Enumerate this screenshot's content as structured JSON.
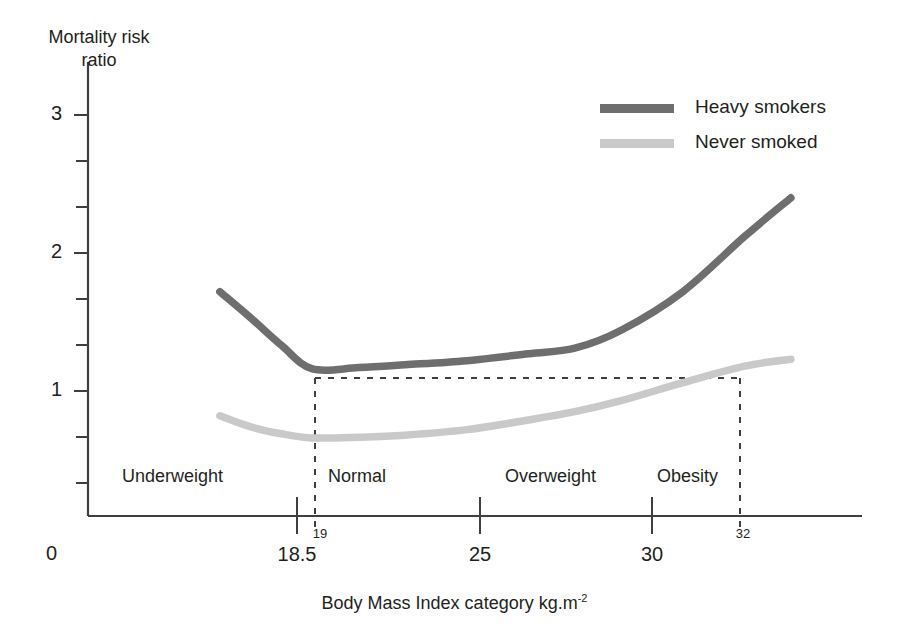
{
  "chart_data": {
    "type": "line",
    "title": "",
    "xlabel": "Body Mass Index category kg.m-2",
    "xlabel_main": "Body Mass Index category kg.m",
    "xlabel_exponent": "-2",
    "ylabel_line1": "Mortality risk",
    "ylabel_line2": "ratio",
    "grid": false,
    "legend_position": "top-right",
    "ylim": [
      0,
      3.3
    ],
    "xlim": [
      15,
      40
    ],
    "yticks_major": [
      "1",
      "2",
      "3"
    ],
    "yticks_major_values": [
      1,
      2,
      3
    ],
    "ytick_minor_count": 3,
    "origin_label": "0",
    "xticks": [
      {
        "label": "18.5",
        "value": 18.5
      },
      {
        "label": "25",
        "value": 25
      },
      {
        "label": "30",
        "value": 30
      }
    ],
    "reference_lines": [
      {
        "label": "19",
        "value": 19,
        "style": "dashed",
        "orientation": "vertical"
      },
      {
        "label": "32",
        "value": 32,
        "style": "dashed",
        "orientation": "vertical"
      }
    ],
    "horizontal_reference": {
      "label": "",
      "y_value": 1.16,
      "style": "dashed",
      "from_x": 19,
      "to_x": 32
    },
    "categories": [
      {
        "label": "Underweight",
        "from": 15,
        "to": 19
      },
      {
        "label": "Normal",
        "from": 19,
        "to": 25
      },
      {
        "label": "Overweight",
        "from": 25,
        "to": 30
      },
      {
        "label": "Obesity",
        "from": 30,
        "to": 32
      }
    ],
    "series": [
      {
        "name": "Heavy smokers",
        "color": "#6e6e6e",
        "x": [
          16.0,
          17.0,
          18.0,
          19.0,
          20.5,
          22.0,
          24.0,
          26.0,
          27.5,
          29.0,
          31.0,
          33.0,
          34.5
        ],
        "values": [
          1.72,
          1.53,
          1.33,
          1.16,
          1.17,
          1.19,
          1.22,
          1.27,
          1.31,
          1.44,
          1.72,
          2.12,
          2.4
        ]
      },
      {
        "name": "Never smoked",
        "color": "#c9c9c9",
        "x": [
          16.0,
          17.0,
          18.0,
          19.0,
          20.5,
          22.0,
          24.0,
          26.0,
          27.5,
          29.0,
          31.0,
          33.0,
          34.5
        ],
        "values": [
          0.82,
          0.74,
          0.69,
          0.66,
          0.665,
          0.68,
          0.72,
          0.79,
          0.85,
          0.93,
          1.06,
          1.18,
          1.23
        ]
      }
    ],
    "legend": [
      {
        "label": "Heavy smokers",
        "color": "#6e6e6e"
      },
      {
        "label": "Never smoked",
        "color": "#c9c9c9"
      }
    ],
    "axis_color": "#3f3f3f"
  }
}
